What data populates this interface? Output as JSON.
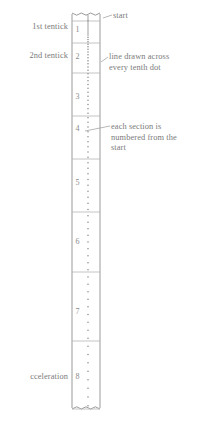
{
  "diagram": {
    "tape": {
      "x_left": 72,
      "x_right": 100,
      "y_top": 13,
      "y_bottom": 409,
      "fill": "#ffffff",
      "stroke": "#8f8f8f",
      "dot_color": "#8a8a8a",
      "section_line_color": "#b5b5b5"
    },
    "section_numbers": [
      {
        "label": "1",
        "y": 30
      },
      {
        "label": "2",
        "y": 57
      },
      {
        "label": "3",
        "y": 97
      },
      {
        "label": "4",
        "y": 129
      },
      {
        "label": "5",
        "y": 183
      },
      {
        "label": "6",
        "y": 242
      },
      {
        "label": "7",
        "y": 312
      },
      {
        "label": "8",
        "y": 377
      }
    ],
    "section_lines_y": [
      21,
      43,
      73,
      116,
      159,
      212,
      272,
      341,
      409
    ],
    "dots_y": [
      16,
      18,
      20,
      21,
      23,
      25,
      27,
      29,
      31,
      33,
      35,
      37.2,
      39.5,
      41.8,
      44.2,
      46.7,
      49.3,
      52,
      54.8,
      57.7,
      60.7,
      63.8,
      67,
      70.3,
      73.7,
      77.2,
      80.8,
      84.5,
      88.3,
      92.2,
      96.2,
      100.3,
      104.5,
      108.8,
      113.2,
      117.7,
      122.3,
      127,
      131.8,
      136.7,
      141.7,
      146.8,
      152,
      157.3,
      162.7,
      168.2,
      173.8,
      179.5,
      185.3,
      191.2,
      197.2,
      203.3,
      209.5,
      215.8,
      222.2,
      228.7,
      235.3,
      242,
      248.8,
      255.7,
      262.7,
      269.8,
      277,
      284.3,
      291.7,
      299.2,
      306.8,
      314.5,
      322.3,
      330.2,
      338.2,
      346.3,
      354.5,
      362.8,
      371.2,
      379.7,
      388.3,
      397,
      405.8
    ],
    "labels_left": [
      {
        "text": "1st tentick",
        "x_right": 68,
        "y": 22
      },
      {
        "text": "2nd tentick",
        "x_right": 68,
        "y": 51
      },
      {
        "text": "cceleration",
        "x_right": 68,
        "y": 372,
        "clipped": true
      }
    ],
    "annotations_right": [
      {
        "lines": [
          "start"
        ],
        "x": 113,
        "y": 11,
        "leader": {
          "x1": 103,
          "y1": 18,
          "x2": 112,
          "y2": 15
        }
      },
      {
        "lines": [
          "line drawn across",
          "every tenth dot"
        ],
        "x": 109,
        "y": 52,
        "leader": {
          "x1": 101,
          "y1": 62,
          "x2": 108,
          "y2": 57
        }
      },
      {
        "lines": [
          "each section is",
          "numbered from the",
          "start"
        ],
        "x": 111,
        "y": 122,
        "leader": {
          "x1": 85,
          "y1": 131,
          "x2": 110,
          "y2": 126
        }
      }
    ]
  }
}
